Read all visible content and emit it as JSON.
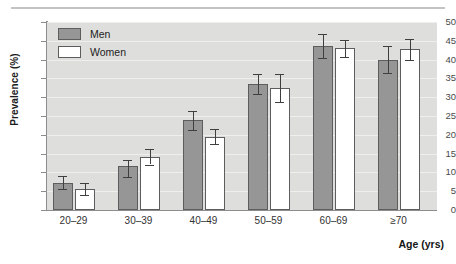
{
  "figure": {
    "background_color": "#ffffff",
    "plot_background_color": "#dededc",
    "top_rule_color": "#c3c3c3"
  },
  "legend": {
    "position": "top-left-inside",
    "entries": [
      {
        "label": "Men",
        "color": "#969696",
        "swatch": "men-swatch"
      },
      {
        "label": "Women",
        "color": "#ffffff",
        "swatch": "women-swatch"
      }
    ]
  },
  "axes": {
    "y_label": "Prevalence (%)",
    "x_label": "Age (yrs)",
    "y_ticks": [
      "0",
      "5",
      "10",
      "15",
      "20",
      "25",
      "30",
      "35",
      "40",
      "45",
      "50"
    ],
    "x_ticks": [
      "20–29",
      "30–39",
      "40–49",
      "50–59",
      "60–69",
      "≥70"
    ]
  },
  "chart_data": {
    "type": "bar",
    "title": "",
    "xlabel": "Age (yrs)",
    "ylabel": "Prevalence (%)",
    "ylim": [
      0,
      50
    ],
    "ytick_step": 5,
    "grid": true,
    "grid_axis": "y",
    "legend_position": "upper left (inside axes)",
    "error_bars": "symmetric 95% CI",
    "categories": [
      "20–29",
      "30–39",
      "40–49",
      "50–59",
      "60–69",
      "≥70"
    ],
    "series": [
      {
        "name": "Men",
        "color": "#969696",
        "values": [
          7.3,
          11.7,
          24.0,
          33.5,
          43.5,
          40.0
        ],
        "err_low": [
          1.7,
          2.8,
          2.8,
          2.6,
          3.2,
          3.5
        ],
        "err_high": [
          1.7,
          1.6,
          2.3,
          2.8,
          3.2,
          3.5
        ]
      },
      {
        "name": "Women",
        "color": "#ffffff",
        "values": [
          5.7,
          14.2,
          19.5,
          32.5,
          43.0,
          42.7
        ],
        "err_low": [
          1.6,
          2.1,
          2.0,
          3.7,
          2.3,
          2.7
        ],
        "err_high": [
          1.6,
          2.0,
          2.1,
          3.7,
          2.3,
          2.7
        ]
      }
    ]
  }
}
